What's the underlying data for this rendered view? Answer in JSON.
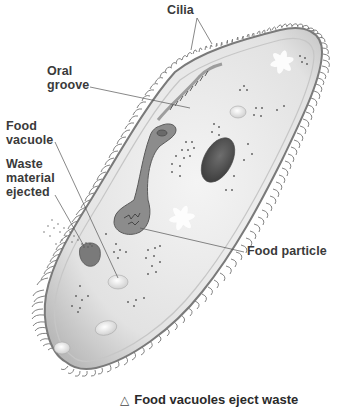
{
  "diagram": {
    "labels": {
      "cilia": "Cilia",
      "oral_groove": "Oral\ngroove",
      "food_vacuole": "Food\nvacuole",
      "waste_material": "Waste\nmaterial\nejected",
      "food_particle": "Food particle"
    },
    "caption": {
      "marker": "△",
      "text": "Food vacuoles eject waste"
    },
    "colors": {
      "body_fill": "#e6e6e6",
      "body_outline": "#7a7a7a",
      "cilia": "#4a4a4a",
      "nucleus": "#555555",
      "oral_groove": "#8a8a8a",
      "label_text": "#3a3a3a",
      "leader_line": "#555555",
      "background": "#ffffff"
    }
  }
}
